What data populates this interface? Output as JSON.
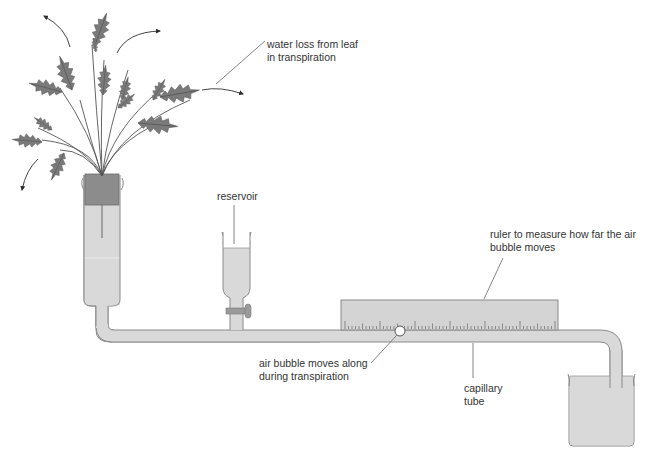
{
  "labels": {
    "water_loss": "water loss from leaf\nin transpiration",
    "reservoir": "reservoir",
    "ruler": "ruler to measure how far the air\nbubble moves",
    "air_bubble": "air bubble moves along\nduring transpiration",
    "capillary": "capillary\ntube"
  },
  "colors": {
    "leaf": "#7a7a7a",
    "leaf_edge": "#5e5e5e",
    "stem": "#555555",
    "water": "#d9d9d9",
    "glass_edge": "#8a8a8a",
    "bung": "#8c8c8c",
    "ruler": "#d4d4d4",
    "arrow": "#2b2b2b",
    "leader_line": "#666666"
  },
  "ruler": {
    "minor_ticks": 60,
    "major_every": 10,
    "mid_every": 5
  }
}
